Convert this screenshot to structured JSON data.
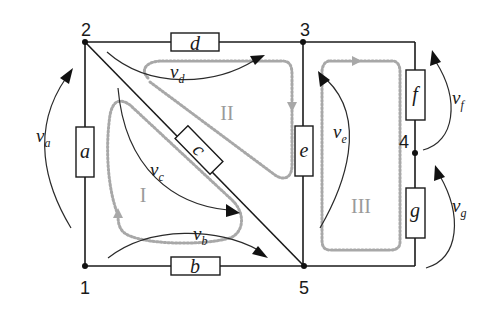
{
  "diagram": {
    "type": "circuit",
    "nodes": [
      {
        "id": "1",
        "label": "1"
      },
      {
        "id": "2",
        "label": "2"
      },
      {
        "id": "3",
        "label": "3"
      },
      {
        "id": "4",
        "label": "4"
      },
      {
        "id": "5",
        "label": "5"
      }
    ],
    "components": [
      {
        "id": "a",
        "label": "a",
        "between": [
          "1",
          "2"
        ]
      },
      {
        "id": "b",
        "label": "b",
        "between": [
          "1",
          "5"
        ]
      },
      {
        "id": "c",
        "label": "c",
        "between": [
          "2",
          "5"
        ]
      },
      {
        "id": "d",
        "label": "d",
        "between": [
          "2",
          "3"
        ]
      },
      {
        "id": "e",
        "label": "e",
        "between": [
          "3",
          "5"
        ]
      },
      {
        "id": "f",
        "label": "f",
        "between": [
          "3",
          "4"
        ]
      },
      {
        "id": "g",
        "label": "g",
        "between": [
          "4",
          "5"
        ]
      }
    ],
    "voltages": [
      {
        "id": "va",
        "symbol": "v",
        "sub": "a"
      },
      {
        "id": "vb",
        "symbol": "v",
        "sub": "b"
      },
      {
        "id": "vc",
        "symbol": "v",
        "sub": "c"
      },
      {
        "id": "vd",
        "symbol": "v",
        "sub": "d"
      },
      {
        "id": "ve",
        "symbol": "v",
        "sub": "e"
      },
      {
        "id": "vf",
        "symbol": "v",
        "sub": "f"
      },
      {
        "id": "vg",
        "symbol": "v",
        "sub": "g"
      }
    ],
    "loops": [
      {
        "id": "I",
        "label": "I"
      },
      {
        "id": "II",
        "label": "II"
      },
      {
        "id": "III",
        "label": "III"
      }
    ],
    "colors": {
      "wire": "#1a1a1a",
      "loop": "#a8a8a8",
      "loop_label": "#9a9a9a"
    }
  }
}
